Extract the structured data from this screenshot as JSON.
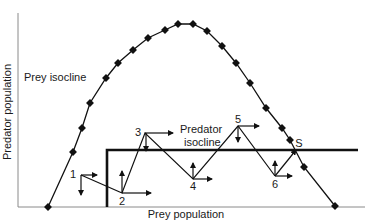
{
  "figure": {
    "x_axis_label": "Prey population",
    "y_axis_label": "Predator population",
    "prey_isocline_label": "Prey isocline",
    "predator_isocline_label_line1": "Predator",
    "predator_isocline_label_line2": "isocline",
    "equilibrium_label": "S",
    "trajectory_points": [
      {
        "label": "1"
      },
      {
        "label": "2"
      },
      {
        "label": "3"
      },
      {
        "label": "4"
      },
      {
        "label": "5"
      },
      {
        "label": "6"
      }
    ]
  },
  "colors": {
    "line": "#111111",
    "axis": "#8a8a8a",
    "background": "#ffffff"
  }
}
